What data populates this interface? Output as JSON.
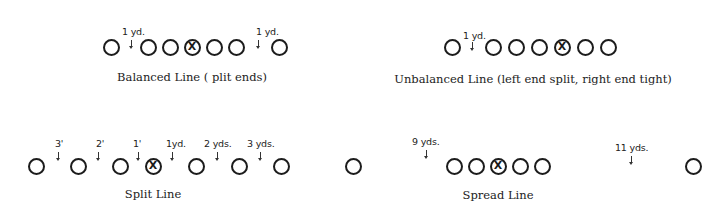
{
  "formations": [
    {
      "id": "balanced",
      "caption": "Balanced Line ( plit ends)",
      "caption_pos": {
        "x": 192,
        "y": 70
      },
      "row_y": 47,
      "players": [
        {
          "x": 111,
          "center": false
        },
        {
          "x": 148,
          "center": false
        },
        {
          "x": 170,
          "center": false
        },
        {
          "x": 192,
          "center": true
        },
        {
          "x": 214,
          "center": false
        },
        {
          "x": 236,
          "center": false
        },
        {
          "x": 279,
          "center": false
        }
      ],
      "splits": [
        {
          "text": "1 yd.",
          "label_x": 122,
          "label_y": 26,
          "arrow_x": 131,
          "arrow_y": 40
        },
        {
          "text": "1 yd.",
          "label_x": 256,
          "label_y": 26,
          "arrow_x": 258,
          "arrow_y": 40
        }
      ]
    },
    {
      "id": "unbalanced",
      "caption": "Unbalanced Line (left end split, right end tight)",
      "caption_pos": {
        "x": 533,
        "y": 72
      },
      "row_y": 47,
      "players": [
        {
          "x": 452,
          "center": false
        },
        {
          "x": 493,
          "center": false
        },
        {
          "x": 516,
          "center": false
        },
        {
          "x": 539,
          "center": false
        },
        {
          "x": 562,
          "center": true
        },
        {
          "x": 585,
          "center": false
        },
        {
          "x": 608,
          "center": false
        }
      ],
      "splits": [
        {
          "text": "1 yd.",
          "label_x": 463,
          "label_y": 30,
          "arrow_x": 472,
          "arrow_y": 42
        }
      ]
    },
    {
      "id": "split",
      "caption": "Split Line",
      "caption_pos": {
        "x": 153,
        "y": 187
      },
      "row_y": 166,
      "players": [
        {
          "x": 36,
          "center": false
        },
        {
          "x": 78,
          "center": false
        },
        {
          "x": 120,
          "center": false
        },
        {
          "x": 153,
          "center": true
        },
        {
          "x": 196,
          "center": false
        },
        {
          "x": 239,
          "center": false
        },
        {
          "x": 281,
          "center": false
        }
      ],
      "splits": [
        {
          "text": "3'",
          "label_x": 55,
          "label_y": 138,
          "arrow_x": 58,
          "arrow_y": 152
        },
        {
          "text": "2'",
          "label_x": 96,
          "label_y": 138,
          "arrow_x": 98,
          "arrow_y": 152
        },
        {
          "text": "1'",
          "label_x": 133,
          "label_y": 138,
          "arrow_x": 138,
          "arrow_y": 152
        },
        {
          "text": "1yd.",
          "label_x": 166,
          "label_y": 138,
          "arrow_x": 172,
          "arrow_y": 152
        },
        {
          "text": "2 yds.",
          "label_x": 204,
          "label_y": 138,
          "arrow_x": 217,
          "arrow_y": 152
        },
        {
          "text": "3 yds.",
          "label_x": 247,
          "label_y": 138,
          "arrow_x": 260,
          "arrow_y": 152
        }
      ]
    },
    {
      "id": "spread",
      "caption": "Spread Line",
      "caption_pos": {
        "x": 498,
        "y": 188
      },
      "row_y": 166,
      "players": [
        {
          "x": 353,
          "center": false
        },
        {
          "x": 454,
          "center": false
        },
        {
          "x": 476,
          "center": false
        },
        {
          "x": 498,
          "center": true
        },
        {
          "x": 520,
          "center": false
        },
        {
          "x": 542,
          "center": false
        },
        {
          "x": 693,
          "center": false
        }
      ],
      "splits": [
        {
          "text": "9 yds.",
          "label_x": 412,
          "label_y": 136,
          "arrow_x": 426,
          "arrow_y": 150
        },
        {
          "text": "11 yds.",
          "label_x": 615,
          "label_y": 142,
          "arrow_x": 631,
          "arrow_y": 156
        }
      ]
    }
  ],
  "center_mark": "X"
}
